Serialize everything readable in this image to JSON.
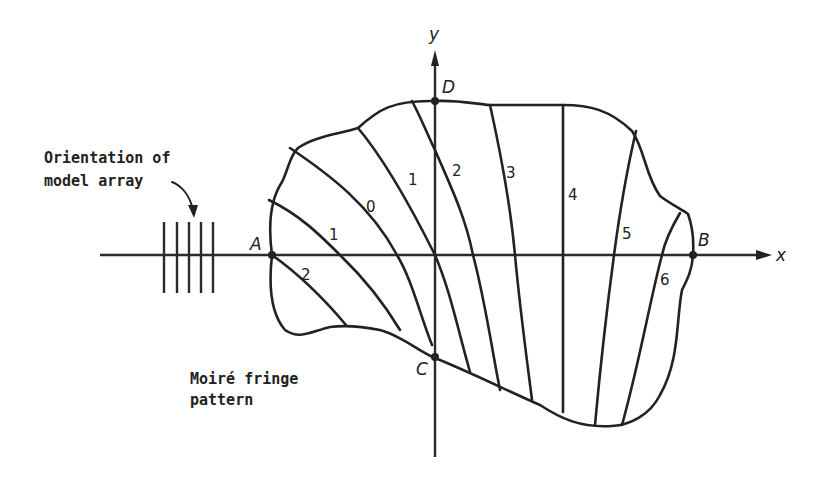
{
  "figure": {
    "axes": {
      "x_label": "x",
      "y_label": "y"
    },
    "points": {
      "A": "A",
      "B": "B",
      "C": "C",
      "D": "D"
    },
    "fringe_orders": {
      "f2_left": "2",
      "f1_left": "1",
      "f0": "0",
      "f1_upper": "1",
      "f2": "2",
      "f3": "3",
      "f4": "4",
      "f5": "5",
      "f6": "6"
    },
    "annotations": {
      "model_array_line1": "Orientation of",
      "model_array_line2": "model array",
      "moire_line1": "Moiré fringe",
      "moire_line2": "pattern"
    },
    "colors": {
      "ink": "#222222",
      "background": "#ffffff"
    }
  }
}
